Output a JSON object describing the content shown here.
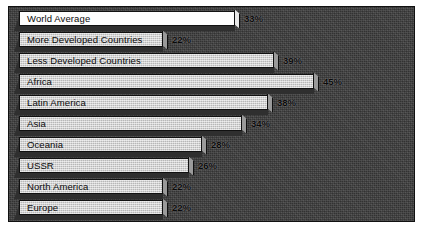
{
  "chart_data": {
    "type": "bar",
    "orientation": "horizontal",
    "title": "",
    "xlabel": "",
    "ylabel": "",
    "xlim": [
      0,
      50
    ],
    "grid": false,
    "legend": false,
    "value_suffix": "%",
    "categories": [
      "World Average",
      "More Developed Countries",
      "Less Developed Countries",
      "Africa",
      "Latin America",
      "Asia",
      "Oceania",
      "USSR",
      "North America",
      "Europe"
    ],
    "values": [
      33,
      22,
      39,
      45,
      38,
      34,
      28,
      26,
      22,
      22
    ],
    "value_labels": [
      "33%",
      "22%",
      "39%",
      "45%",
      "38%",
      "34%",
      "28%",
      "26%",
      "22%",
      "22%"
    ],
    "bars": [
      {
        "label": "World Average",
        "value": 33,
        "value_label": "33%",
        "highlight": true
      },
      {
        "label": "More Developed Countries",
        "value": 22,
        "value_label": "22%",
        "highlight": false
      },
      {
        "label": "Less Developed Countries",
        "value": 39,
        "value_label": "39%",
        "highlight": false
      },
      {
        "label": "Africa",
        "value": 45,
        "value_label": "45%",
        "highlight": false
      },
      {
        "label": "Latin America",
        "value": 38,
        "value_label": "38%",
        "highlight": false
      },
      {
        "label": "Asia",
        "value": 34,
        "value_label": "34%",
        "highlight": false
      },
      {
        "label": "Oceania",
        "value": 28,
        "value_label": "28%",
        "highlight": false
      },
      {
        "label": "USSR",
        "value": 26,
        "value_label": "26%",
        "highlight": false
      },
      {
        "label": "North America",
        "value": 22,
        "value_label": "22%",
        "highlight": false
      },
      {
        "label": "Europe",
        "value": 22,
        "value_label": "22%",
        "highlight": false
      }
    ],
    "colors": {
      "plot_background": "#3b3b3b",
      "bar_fill": "#c9c9c9",
      "bar_highlight_fill": "#fdfdfd",
      "bar_outline": "#111111",
      "bar_shadow": "#2f2f2f",
      "bar_cap": "#9a9a9a",
      "text": "#0c0c0c",
      "page_background": "#ffffff"
    }
  },
  "layout": {
    "row_pitch": 21,
    "first_row_top": 4,
    "bar_origin_x": 10,
    "px_per_percent": 6.55,
    "bar_height": 15
  }
}
